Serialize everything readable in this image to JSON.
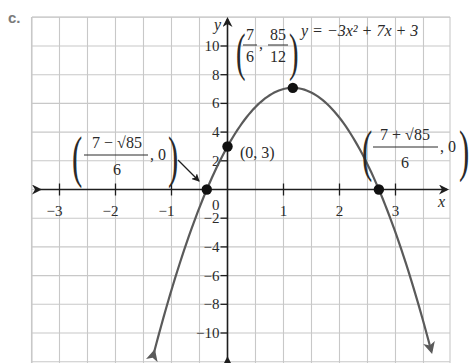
{
  "part_label": "c.",
  "chart_data": {
    "type": "line",
    "title": "",
    "function": "y = -3x^2 + 7x + 3",
    "coefficients": {
      "a": -3,
      "b": 7,
      "c": 3
    },
    "xlabel": "x",
    "ylabel": "y",
    "xlim": [
      -3.5,
      4
    ],
    "ylim": [
      -12,
      12
    ],
    "grid": true,
    "x_grid_step": 0.5,
    "y_grid_step": 2,
    "x_ticks": [
      -3,
      -2,
      -1,
      1,
      2,
      3
    ],
    "x_tick_labels": [
      "−3",
      "−2",
      "−1",
      "1",
      "2",
      "3"
    ],
    "y_ticks": [
      10,
      8,
      6,
      4,
      2,
      -2,
      -4,
      -6,
      -8,
      -10
    ],
    "y_tick_labels": [
      "10",
      "8",
      "6",
      "4",
      "2",
      "−2",
      "−4",
      "−6",
      "−8",
      "−10"
    ],
    "origin_label": "0",
    "curve_domain": [
      -1.31,
      3.64
    ],
    "points": [
      {
        "name": "vertex",
        "x": 1.1667,
        "y": 7.0833,
        "label": "(7/6, 85/12)"
      },
      {
        "name": "y-intercept",
        "x": 0,
        "y": 3,
        "label": "(0, 3)"
      },
      {
        "name": "x-intercept-left",
        "x": -0.3699,
        "y": 0,
        "label": "((7 − √85)/6, 0)"
      },
      {
        "name": "x-intercept-right",
        "x": 2.7033,
        "y": 0,
        "label": "((7 + √85)/6, 0)"
      }
    ],
    "annotations": {
      "equation": "y = −3x² + 7x + 3",
      "vertex_num_x": "7",
      "vertex_den_x": "6",
      "vertex_num_y": "85",
      "vertex_den_y": "12",
      "y_intercept": "(0, 3)",
      "left_root_num": "7 − √85",
      "left_root_den": "6",
      "right_root_num": "7 + √85",
      "right_root_den": "6",
      "root_y": "0"
    },
    "colors": {
      "grid": "#c8c8c8",
      "axis": "#1e1e1e",
      "curve": "#5a5a5a",
      "point": "#111111",
      "text": "#2a2a2a"
    }
  }
}
